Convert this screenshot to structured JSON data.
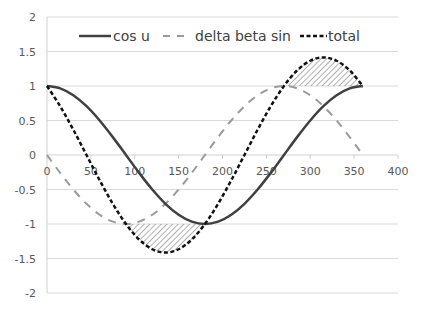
{
  "chart_data": {
    "type": "line",
    "title": "",
    "xlabel": "",
    "ylabel": "",
    "xlim": [
      0,
      400
    ],
    "ylim": [
      -2,
      2
    ],
    "x_ticks": [
      0,
      50,
      100,
      150,
      200,
      250,
      300,
      350,
      400
    ],
    "y_ticks": [
      2,
      1.5,
      1,
      0.5,
      0,
      -0.5,
      -1,
      -1.5,
      -2
    ],
    "x_tick_labels": [
      "0",
      "50",
      "100",
      "150",
      "200",
      "250",
      "300",
      "350",
      "400"
    ],
    "y_tick_labels": [
      "2",
      "1.5",
      "1",
      "0.5",
      "0",
      "-0.5",
      "-1",
      "-1.5",
      "-2"
    ],
    "grid": "horizontal",
    "legend_position": "top",
    "x": [
      0,
      15,
      30,
      45,
      60,
      75,
      90,
      105,
      120,
      135,
      150,
      165,
      180,
      195,
      210,
      225,
      240,
      255,
      270,
      285,
      300,
      315,
      330,
      345,
      360
    ],
    "series": [
      {
        "name": "cos u",
        "style": "solid",
        "color": "#404040",
        "values": [
          1,
          0.966,
          0.866,
          0.707,
          0.5,
          0.259,
          0,
          -0.259,
          -0.5,
          -0.707,
          -0.866,
          -0.966,
          -1,
          -0.966,
          -0.866,
          -0.707,
          -0.5,
          -0.259,
          0,
          0.259,
          0.5,
          0.707,
          0.866,
          0.966,
          1
        ]
      },
      {
        "name": "delta beta sin",
        "style": "long-dash",
        "color": "#9a9a9a",
        "values": [
          0,
          -0.259,
          -0.5,
          -0.707,
          -0.866,
          -0.966,
          -1,
          -0.966,
          -0.866,
          -0.707,
          -0.5,
          -0.259,
          0,
          0.259,
          0.5,
          0.707,
          0.866,
          0.966,
          1,
          0.966,
          0.866,
          0.707,
          0.5,
          0.259,
          0
        ]
      },
      {
        "name": "total",
        "style": "short-dash",
        "color": "#111111",
        "values": [
          1,
          0.707,
          0.366,
          0,
          -0.366,
          -0.707,
          -1,
          -1.225,
          -1.366,
          -1.414,
          -1.366,
          -1.225,
          -1,
          -0.707,
          -0.366,
          0,
          0.366,
          0.707,
          1,
          1.225,
          1.366,
          1.414,
          1.366,
          1.225,
          1
        ]
      }
    ],
    "shaded_regions": [
      {
        "description": "hatched area where total < -1",
        "x_range": [
          90,
          180
        ],
        "bound": -1
      },
      {
        "description": "hatched area where total > 1",
        "x_range": [
          270,
          360
        ],
        "bound": 1
      }
    ]
  },
  "legend": [
    {
      "label": "cos u"
    },
    {
      "label": "delta beta sin"
    },
    {
      "label": "total"
    }
  ]
}
